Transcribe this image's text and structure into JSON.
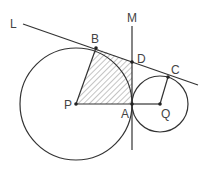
{
  "diagram": {
    "type": "geometry",
    "colors": {
      "stroke": "#333333",
      "hatch": "#888888",
      "label": "#444444"
    },
    "points": {
      "P": {
        "label": "P",
        "x": 76,
        "y": 104
      },
      "Q": {
        "label": "Q",
        "x": 160,
        "y": 104
      },
      "A": {
        "label": "A",
        "x": 132,
        "y": 104
      },
      "B": {
        "label": "B",
        "x": 96,
        "y": 48
      },
      "C": {
        "label": "C",
        "x": 168,
        "y": 77
      },
      "D": {
        "label": "D",
        "x": 132,
        "y": 62
      }
    },
    "circles": [
      {
        "name": "circle-P",
        "center": "P",
        "r": 56
      },
      {
        "name": "circle-Q",
        "center": "Q",
        "r": 28
      }
    ],
    "lines": [
      {
        "name": "L",
        "label": "L",
        "from": [
          23,
          24
        ],
        "to": [
          198,
          85
        ]
      },
      {
        "name": "M",
        "label": "M",
        "from": [
          132,
          26
        ],
        "to": [
          132,
          150
        ]
      }
    ],
    "segments": [
      "PB",
      "PA",
      "AQ",
      "QC"
    ],
    "shaded_region": [
      "P",
      "B",
      "D",
      "A"
    ],
    "labels": {
      "L": "L",
      "M": "M",
      "B": "B",
      "D": "D",
      "C": "C",
      "P": "P",
      "A": "A",
      "Q": "Q"
    }
  }
}
